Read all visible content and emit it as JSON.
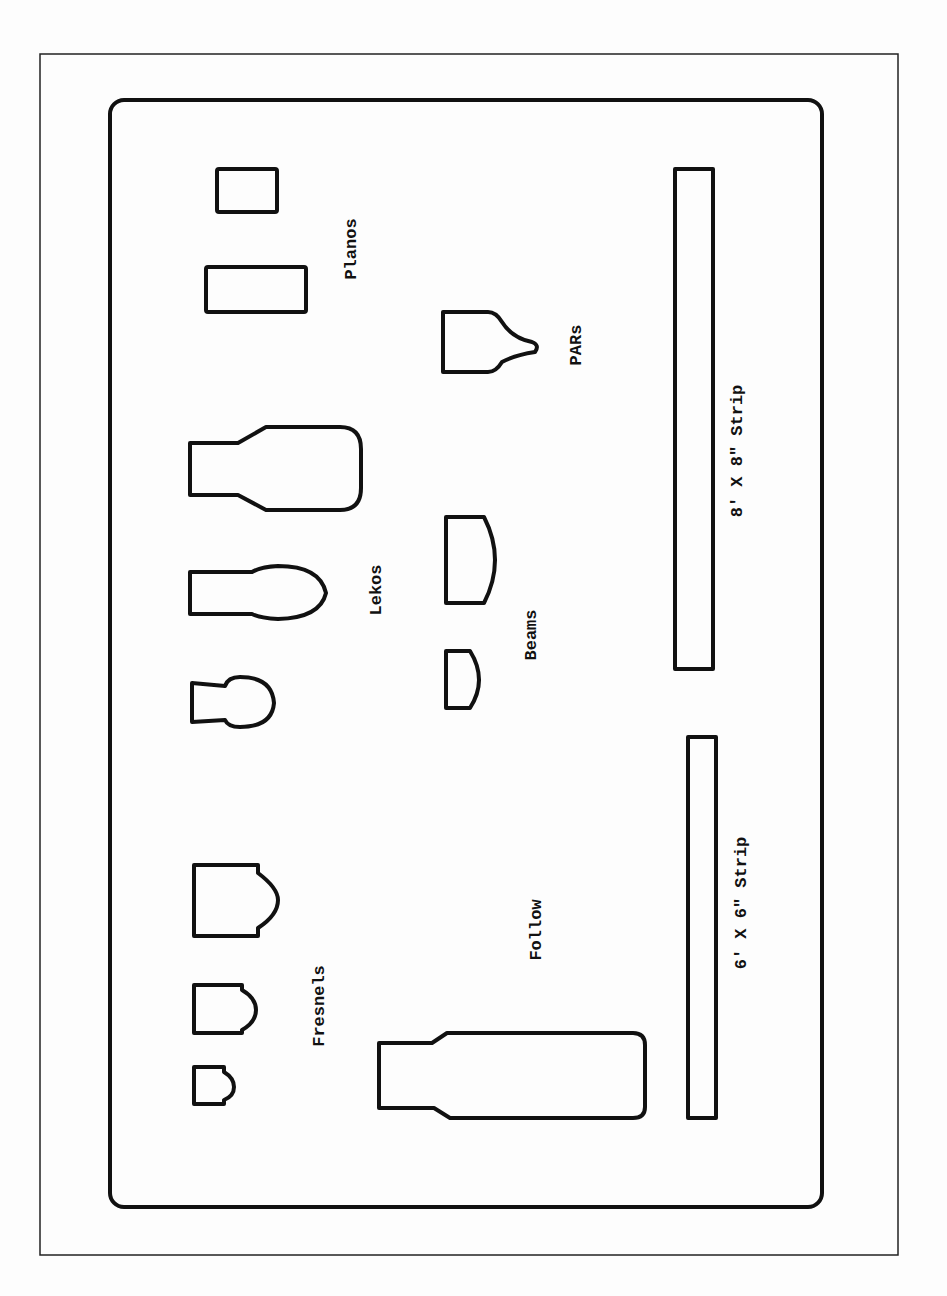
{
  "diagram": {
    "type": "lighting-instrument-template",
    "colors": {
      "stroke": "#111111",
      "background": "#fdfdfd",
      "frame": "#222222"
    },
    "groups": [
      {
        "id": "planos",
        "label": "Planos",
        "count": 2
      },
      {
        "id": "pars",
        "label": "PARs",
        "count": 1
      },
      {
        "id": "lekos",
        "label": "Lekos",
        "count": 3
      },
      {
        "id": "beams",
        "label": "Beams",
        "count": 2
      },
      {
        "id": "strip8",
        "label": "8' X 8\" Strip",
        "count": 1
      },
      {
        "id": "fresnels",
        "label": "Fresnels",
        "count": 3
      },
      {
        "id": "follow",
        "label": "Follow",
        "count": 1
      },
      {
        "id": "strip6",
        "label": "6' X 6\" Strip",
        "count": 1
      }
    ]
  },
  "labels": {
    "planos": "Planos",
    "pars": "PARs",
    "lekos": "Lekos",
    "beams": "Beams",
    "strip8": "8' X 8\" Strip",
    "fresnels": "Fresnels",
    "follow": "Follow",
    "strip6": "6' X 6\" Strip"
  }
}
